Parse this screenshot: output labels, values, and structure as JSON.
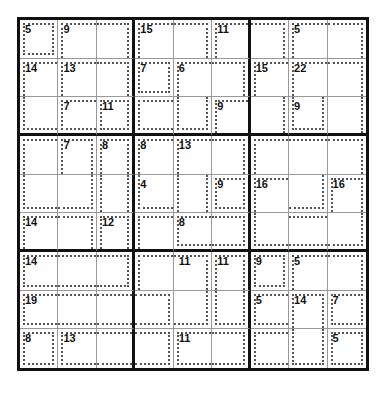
{
  "puzzle": {
    "type": "killer-sudoku",
    "size": 9,
    "clues": [
      {
        "row": 0,
        "col": 0,
        "value": "5"
      },
      {
        "row": 0,
        "col": 1,
        "value": "9"
      },
      {
        "row": 0,
        "col": 3,
        "value": "15"
      },
      {
        "row": 0,
        "col": 5,
        "value": "11"
      },
      {
        "row": 0,
        "col": 7,
        "value": "5"
      },
      {
        "row": 1,
        "col": 0,
        "value": "14"
      },
      {
        "row": 1,
        "col": 1,
        "value": "13"
      },
      {
        "row": 1,
        "col": 3,
        "value": "7"
      },
      {
        "row": 1,
        "col": 4,
        "value": "6"
      },
      {
        "row": 1,
        "col": 6,
        "value": "15"
      },
      {
        "row": 1,
        "col": 7,
        "value": "22"
      },
      {
        "row": 2,
        "col": 1,
        "value": "7"
      },
      {
        "row": 2,
        "col": 2,
        "value": "11"
      },
      {
        "row": 2,
        "col": 5,
        "value": "9"
      },
      {
        "row": 2,
        "col": 7,
        "value": "9"
      },
      {
        "row": 3,
        "col": 1,
        "value": "7"
      },
      {
        "row": 3,
        "col": 2,
        "value": "8"
      },
      {
        "row": 3,
        "col": 3,
        "value": "8"
      },
      {
        "row": 3,
        "col": 4,
        "value": "13"
      },
      {
        "row": 4,
        "col": 3,
        "value": "4"
      },
      {
        "row": 4,
        "col": 5,
        "value": "9"
      },
      {
        "row": 4,
        "col": 6,
        "value": "16"
      },
      {
        "row": 4,
        "col": 8,
        "value": "16"
      },
      {
        "row": 5,
        "col": 0,
        "value": "14"
      },
      {
        "row": 5,
        "col": 2,
        "value": "12"
      },
      {
        "row": 5,
        "col": 4,
        "value": "8"
      },
      {
        "row": 6,
        "col": 0,
        "value": "14"
      },
      {
        "row": 6,
        "col": 4,
        "value": "11"
      },
      {
        "row": 6,
        "col": 5,
        "value": "11"
      },
      {
        "row": 6,
        "col": 6,
        "value": "9"
      },
      {
        "row": 6,
        "col": 7,
        "value": "5"
      },
      {
        "row": 7,
        "col": 0,
        "value": "19"
      },
      {
        "row": 7,
        "col": 6,
        "value": "5"
      },
      {
        "row": 7,
        "col": 7,
        "value": "14"
      },
      {
        "row": 7,
        "col": 8,
        "value": "7"
      },
      {
        "row": 8,
        "col": 0,
        "value": "8"
      },
      {
        "row": 8,
        "col": 1,
        "value": "13"
      },
      {
        "row": 8,
        "col": 4,
        "value": "11"
      },
      {
        "row": 8,
        "col": 8,
        "value": "5"
      }
    ],
    "cage_borders": [
      "tlbr",
      "tl",
      "tr",
      "tl",
      "tr",
      "tl",
      "tr",
      "tl",
      "tr",
      "tl",
      "tl",
      "tr",
      "tlbr",
      "tl",
      "tr",
      "tl",
      "tl",
      "tr",
      "lb",
      "tlb",
      "tlbr",
      "tlb",
      "lbr",
      "tl",
      "r",
      "lbr",
      "r",
      "tl",
      "tlr",
      "tlr",
      "tl",
      "tl",
      "tr",
      "tl",
      "t",
      "tr",
      "bl",
      "br",
      "lr",
      "lb",
      "lr",
      "tlbr",
      "tl",
      "br",
      "tlr",
      "tl",
      "tr",
      "tlr",
      "tl",
      "tlb",
      "tbr",
      "bl",
      "tb",
      "br",
      "tlb",
      "tb",
      "tbr",
      "tl",
      "tr",
      "tlr",
      "tlbr",
      "tl",
      "tr",
      "tlb",
      "tb",
      "tb",
      "tbr",
      "rb",
      "lbr",
      "tlb",
      "tlr",
      "tlbr",
      "tlbr",
      "tlb",
      "tb",
      "tbr",
      "tlb",
      "tbr",
      "tlb",
      "lbr",
      "tlbr"
    ],
    "values": [
      "",
      "",
      "",
      "",
      "",
      "",
      "",
      "",
      "",
      "",
      "",
      "",
      "",
      "",
      "",
      "",
      "",
      "",
      "",
      "",
      "",
      "",
      "",
      "",
      "",
      "",
      "",
      "",
      "",
      "",
      "",
      "",
      "",
      "",
      "",
      "",
      "",
      "",
      "",
      "",
      "",
      "",
      "",
      "",
      "",
      "",
      "",
      "",
      "",
      "",
      "",
      "",
      "",
      "",
      "",
      "",
      "",
      "",
      "",
      "",
      "",
      "",
      "",
      "",
      "",
      "",
      "",
      "",
      "",
      "",
      "",
      "",
      "",
      "",
      "",
      "",
      "",
      "",
      "",
      "",
      "",
      ""
    ]
  },
  "colors": {
    "thick_line": "#111111",
    "thin_line": "#9a9a9a",
    "cage_line": "#555555",
    "background": "#ffffff"
  }
}
